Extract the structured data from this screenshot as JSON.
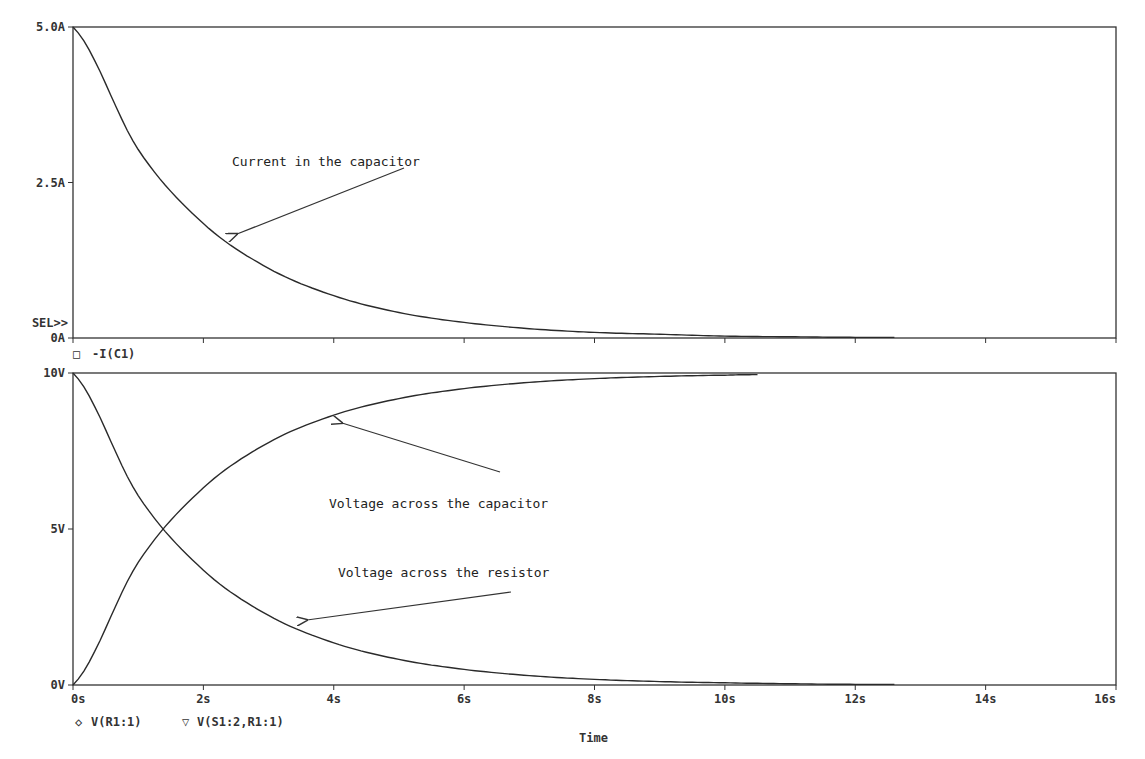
{
  "chart_data": [
    {
      "type": "line",
      "title": "",
      "xlabel": "Time",
      "ylabel": "",
      "xlim": [
        0,
        16
      ],
      "ylim": [
        0,
        5
      ],
      "x_ticks": [
        "0s",
        "2s",
        "4s",
        "6s",
        "8s",
        "10s",
        "12s",
        "14s",
        "16s"
      ],
      "y_ticks": [
        "0A",
        "2.5A",
        "5.0A"
      ],
      "selected_marker": "SEL>>",
      "legend": [
        {
          "symbol": "□",
          "name": "-I(C1)"
        }
      ],
      "annotations": [
        {
          "text": "Current in the capacitor",
          "arrow_to_t": 2.7
        }
      ],
      "series": [
        {
          "name": "-I(C1)",
          "x": [
            0,
            1,
            2,
            3,
            4,
            5,
            6,
            7,
            8,
            9,
            10,
            11,
            12,
            12.6
          ],
          "values": [
            5.0,
            3.03,
            1.84,
            1.12,
            0.68,
            0.41,
            0.25,
            0.15,
            0.09,
            0.06,
            0.03,
            0.02,
            0.01,
            0.01
          ]
        }
      ]
    },
    {
      "type": "line",
      "title": "",
      "xlabel": "Time",
      "ylabel": "",
      "xlim": [
        0,
        16
      ],
      "ylim": [
        0,
        10
      ],
      "x_ticks": [
        "0s",
        "2s",
        "4s",
        "6s",
        "8s",
        "10s",
        "12s",
        "14s",
        "16s"
      ],
      "y_ticks": [
        "0V",
        "5V",
        "10V"
      ],
      "legend": [
        {
          "symbol": "◇",
          "name": "V(R1:1)"
        },
        {
          "symbol": "▽",
          "name": "V(S1:2,R1:1)"
        }
      ],
      "annotations": [
        {
          "text": "Voltage across the capacitor",
          "arrow_to_t": 4.2
        },
        {
          "text": "Voltage across the resistor",
          "arrow_to_t": 3.6
        }
      ],
      "series": [
        {
          "name": "V(R1:1)",
          "x": [
            0,
            1,
            2,
            3,
            4,
            5,
            6,
            7,
            8,
            9,
            10,
            11,
            12,
            12.6
          ],
          "values": [
            10.0,
            6.07,
            3.68,
            2.23,
            1.35,
            0.82,
            0.5,
            0.3,
            0.18,
            0.11,
            0.07,
            0.04,
            0.02,
            0.02
          ]
        },
        {
          "name": "V(S1:2,R1:1)",
          "x": [
            0,
            1,
            2,
            3,
            4,
            5,
            6,
            7,
            8,
            9,
            10,
            10.5
          ],
          "values": [
            0.0,
            3.93,
            6.32,
            7.77,
            8.65,
            9.18,
            9.5,
            9.7,
            9.82,
            9.89,
            9.93,
            9.95
          ]
        }
      ]
    }
  ],
  "labels": {
    "top": {
      "y_max": "5.0A",
      "y_mid": "2.5A",
      "y_min": "0A",
      "sel": "SEL>>",
      "legend_symbol": "□",
      "legend_text": "-I(C1)",
      "annotation": "Current in the capacitor"
    },
    "bottom": {
      "y_max": "10V",
      "y_mid": "5V",
      "y_min": "0V",
      "legend_1_symbol": "◇",
      "legend_1_text": "V(R1:1)",
      "legend_2_symbol": "▽",
      "legend_2_text": "V(S1:2,R1:1)",
      "annotation_cap": "Voltage across the capacitor",
      "annotation_res": "Voltage across the resistor"
    },
    "x_ticks": [
      "0s",
      "2s",
      "4s",
      "6s",
      "8s",
      "10s",
      "12s",
      "14s",
      "16s"
    ],
    "x_axis_title": "Time"
  },
  "colors": {
    "trace": "#2a2a2a",
    "axis": "#333333",
    "background": "#ffffff"
  }
}
